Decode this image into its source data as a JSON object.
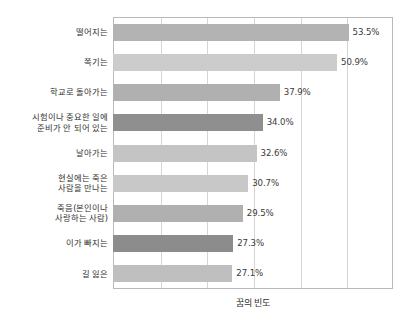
{
  "chart_data": {
    "type": "bar",
    "orientation": "horizontal",
    "title": "",
    "xlabel": "꿈의 빈도",
    "ylabel": "",
    "xlim": [
      0,
      63.6
    ],
    "grid": true,
    "legend": false,
    "value_suffix": "%",
    "categories": [
      "떨어지는",
      "쪽기는",
      "학교로 돌아가는",
      "시험이나 중요한 일에\n준비가 안 되어 있는",
      "날아가는",
      "현실에는 죽은\n사람을 만나는",
      "죽음(본인이나\n사랑하는 사람)",
      "이가 빠지는",
      "길 잃은"
    ],
    "values": [
      53.5,
      50.9,
      37.9,
      34.0,
      32.6,
      30.7,
      29.5,
      27.3,
      27.1
    ],
    "value_labels": [
      "53.5%",
      "50.9%",
      "37.9%",
      "34.0%",
      "32.6%",
      "30.7%",
      "29.5%",
      "27.3%",
      "27.1%"
    ],
    "bar_colors": [
      "#b3b3b3",
      "#cccccc",
      "#b0b0b0",
      "#8f8f8f",
      "#c4c4c4",
      "#c8c8c8",
      "#b0b0b0",
      "#8c8c8c",
      "#bfbfbf"
    ],
    "gridline_values": [
      0,
      10.6,
      21.2,
      31.8,
      42.4,
      53.0,
      63.6
    ],
    "frame_color": "#b9b9b9",
    "grid_color": "#d5d5d5",
    "text_color": "#3a3a3a"
  }
}
